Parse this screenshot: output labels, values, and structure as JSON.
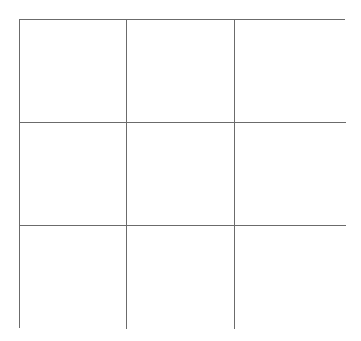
{
  "board": {
    "rows": 3,
    "cols": 3,
    "line_color": "#6b6b6b",
    "background": "#ffffff",
    "cells": [
      [
        "",
        "",
        ""
      ],
      [
        "",
        "",
        ""
      ],
      [
        "",
        "",
        ""
      ]
    ]
  }
}
